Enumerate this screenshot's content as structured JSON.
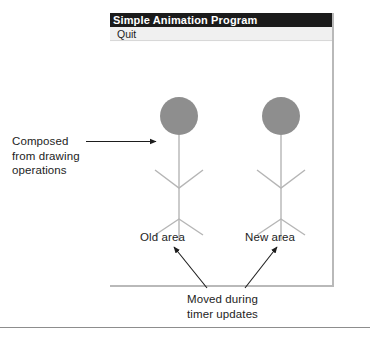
{
  "window": {
    "title": "Simple Animation Program",
    "menu": {
      "items": [
        {
          "label": "Quit",
          "name": "menu-item-quit"
        }
      ]
    },
    "canvas": {
      "figures": [
        {
          "id": "old",
          "caption": "Old area",
          "head_color": "#8e8e8e",
          "limb_color": "#b5b5b5"
        },
        {
          "id": "new",
          "caption": "New area",
          "head_color": "#8e8e8e",
          "limb_color": "#b5b5b5"
        }
      ]
    }
  },
  "annotations": {
    "left": {
      "lines": [
        "Composed",
        "from drawing",
        "operations"
      ],
      "line1": "Composed",
      "line2": "from drawing",
      "line3": "operations"
    },
    "bottom": {
      "lines": [
        "Moved during",
        "timer updates"
      ],
      "line1": "Moved during",
      "line2": "timer updates"
    }
  },
  "colors": {
    "titlebar_bg": "#1b1b1b",
    "titlebar_fg": "#ffffff",
    "menubar_bg": "#f0f0f0",
    "canvas_bg": "#ffffff",
    "head_fill": "#8e8e8e",
    "limb_stroke": "#b5b5b5",
    "annotation_fg": "#1d1d1d",
    "leader_stroke": "#1d1d1d",
    "rule_stroke": "#8d8d8d",
    "window_shadow": "#b9b9b9"
  }
}
